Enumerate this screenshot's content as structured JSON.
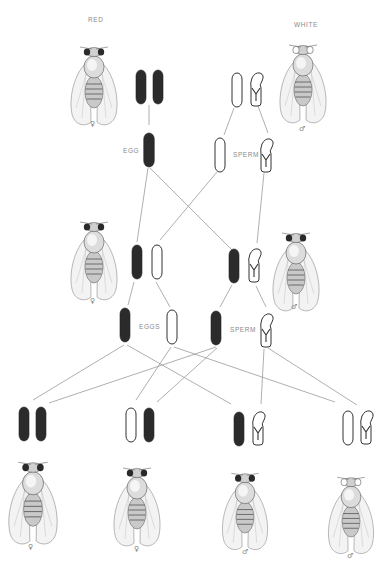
{
  "figure": {
    "labels": {
      "red": "RED",
      "white": "WHITE",
      "egg": "EGG",
      "sperm_p": "SPERM",
      "eggs": "EGGS",
      "sperm_f1": "SPERM"
    },
    "colors": {
      "x_red_fill": "#2b2b2b",
      "x_white_fill": "#ffffff",
      "outline": "#333333",
      "line": "#9a9a9a",
      "label": "#8a8a8a"
    },
    "parents": [
      {
        "id": "P-female",
        "eye": "red",
        "sex_symbol": "♀",
        "chromosomes": [
          "X-red",
          "X-red"
        ]
      },
      {
        "id": "P-male",
        "eye": "white",
        "sex_symbol": "♂",
        "chromosomes": [
          "X-white",
          "Y"
        ]
      }
    ],
    "parent_gametes": {
      "egg": [
        "X-red"
      ],
      "sperm": [
        "X-white",
        "Y"
      ]
    },
    "f1": [
      {
        "id": "F1-female",
        "eye": "red",
        "sex_symbol": "♀",
        "chromosomes": [
          "X-red",
          "X-white"
        ]
      },
      {
        "id": "F1-male",
        "eye": "red",
        "sex_symbol": "♂",
        "chromosomes": [
          "X-red",
          "Y"
        ]
      }
    ],
    "f1_gametes": {
      "eggs": [
        "X-red",
        "X-white"
      ],
      "sperm": [
        "X-red",
        "Y"
      ]
    },
    "f2": [
      {
        "id": "F2-1",
        "eye": "red",
        "sex_symbol": "♀",
        "chromosomes": [
          "X-red",
          "X-red"
        ]
      },
      {
        "id": "F2-2",
        "eye": "red",
        "sex_symbol": "♀",
        "chromosomes": [
          "X-white",
          "X-red"
        ]
      },
      {
        "id": "F2-3",
        "eye": "red",
        "sex_symbol": "♂",
        "chromosomes": [
          "X-red",
          "Y"
        ]
      },
      {
        "id": "F2-4",
        "eye": "white",
        "sex_symbol": "♂",
        "chromosomes": [
          "X-white",
          "Y"
        ]
      }
    ]
  }
}
